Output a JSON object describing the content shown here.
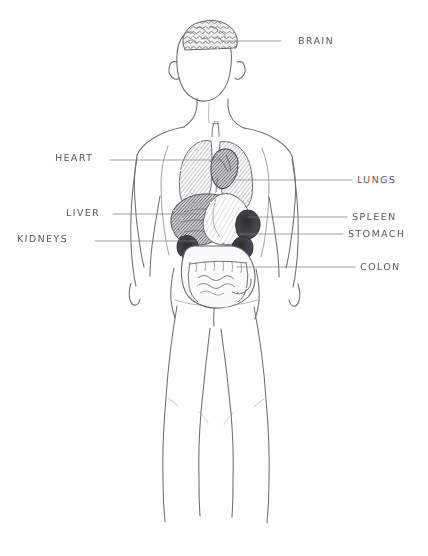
{
  "document": {
    "type": "pencil-sketch-anatomy-diagram",
    "title": "Human body organ diagram",
    "background_color": "#fefefe",
    "ink_color": "#5a5a5e",
    "width": 428,
    "height": 556
  },
  "figure": {
    "name": "human-body-outline",
    "parts": [
      "head",
      "neck",
      "shoulders",
      "arms",
      "torso",
      "hips",
      "legs"
    ]
  },
  "labels": [
    {
      "id": "brain",
      "text": "BRAIN",
      "side": "right",
      "text_x": 298,
      "text_y": 35,
      "line_x1": 281,
      "line_y1": 41,
      "line_x2": 222,
      "line_y2": 41
    },
    {
      "id": "lungs",
      "text": "LUNGS",
      "side": "right",
      "text_x": 357,
      "text_y": 174,
      "line_x1": 352,
      "line_y1": 180,
      "line_x2": 232,
      "line_y2": 180
    },
    {
      "id": "spleen",
      "text": "SPLEEN",
      "side": "right",
      "text_x": 352,
      "text_y": 211,
      "line_x1": 347,
      "line_y1": 217,
      "line_x2": 248,
      "line_y2": 217
    },
    {
      "id": "stomach",
      "text": "STOMACH",
      "side": "right",
      "text_x": 348,
      "text_y": 228,
      "line_x1": 343,
      "line_y1": 234,
      "line_x2": 240,
      "line_y2": 234
    },
    {
      "id": "colon",
      "text": "COLON",
      "side": "right",
      "text_x": 360,
      "text_y": 261,
      "line_x1": 355,
      "line_y1": 267,
      "line_x2": 237,
      "line_y2": 267
    },
    {
      "id": "heart",
      "text": "HEART",
      "side": "left",
      "text_x": 55,
      "text_y": 152,
      "line_x1": 110,
      "line_y1": 160,
      "line_x2": 220,
      "line_y2": 160
    },
    {
      "id": "liver",
      "text": "LIVER",
      "side": "left",
      "text_x": 66,
      "text_y": 207,
      "line_x1": 113,
      "line_y1": 214,
      "line_x2": 200,
      "line_y2": 214
    },
    {
      "id": "kidneys",
      "text": "KIDNEYS",
      "side": "left",
      "text_x": 17,
      "text_y": 233,
      "line_x1": 95,
      "line_y1": 241,
      "line_x2": 196,
      "line_y2": 241
    }
  ],
  "organs": [
    {
      "id": "brain",
      "name": "brain",
      "shading": "dense-squiggle"
    },
    {
      "id": "lungs",
      "name": "lungs",
      "shading": "medium-hatch"
    },
    {
      "id": "heart",
      "name": "heart",
      "shading": "dark"
    },
    {
      "id": "liver",
      "name": "liver",
      "shading": "dark-hatch"
    },
    {
      "id": "stomach",
      "name": "stomach",
      "shading": "light"
    },
    {
      "id": "spleen",
      "name": "spleen",
      "shading": "very-dark"
    },
    {
      "id": "kidneys",
      "name": "kidneys",
      "shading": "very-dark"
    },
    {
      "id": "colon",
      "name": "colon",
      "shading": "outlined-coil"
    }
  ]
}
